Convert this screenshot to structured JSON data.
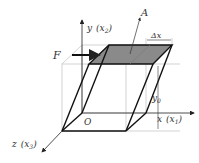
{
  "diagram": {
    "labels": {
      "force": "F",
      "area": "A",
      "y_axis": "y",
      "y_axis_alias": "(x",
      "y_axis_sub": "2",
      "x_axis": "x",
      "x_axis_alias": "(x",
      "x_axis_sub": "1",
      "z_axis": "z",
      "z_axis_alias": "(x",
      "z_axis_sub": "3",
      "origin": "O",
      "displacement": "Δx",
      "height": "y",
      "height_sub": "0",
      "close_paren": ")"
    },
    "colors": {
      "shaded_face": "#8a8a8a",
      "edge": "#111111",
      "guide": "#c8c8c8",
      "axis": "#222222"
    }
  }
}
